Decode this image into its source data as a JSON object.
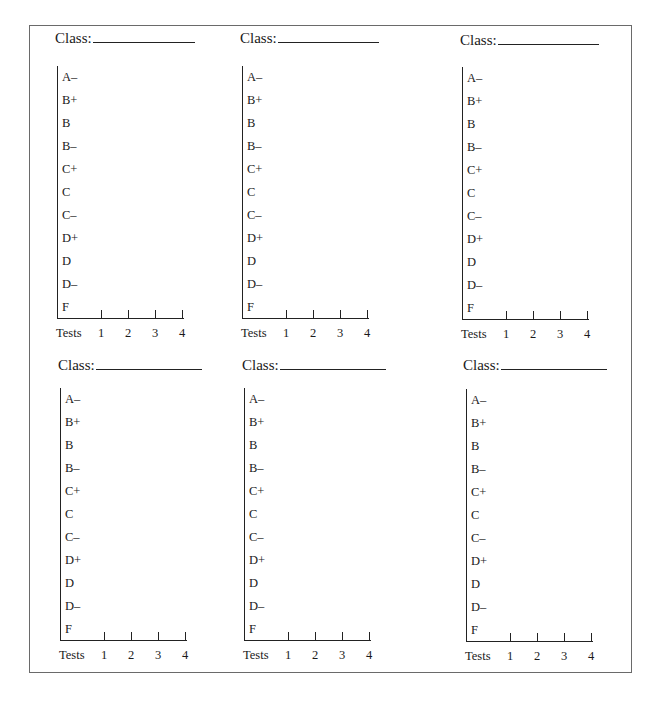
{
  "sheet": {
    "class_label": "Class:",
    "y_axis_grades": [
      "A–",
      "B+",
      "B",
      "B–",
      "C+",
      "C",
      "C–",
      "D+",
      "D",
      "D–",
      "F"
    ],
    "x_axis_title": "Tests",
    "x_axis_ticks": [
      "1",
      "2",
      "3",
      "4"
    ]
  },
  "panels": [
    {
      "class_label": "Class:",
      "class_value": ""
    },
    {
      "class_label": "Class:",
      "class_value": ""
    },
    {
      "class_label": "Class:",
      "class_value": ""
    },
    {
      "class_label": "Class:",
      "class_value": ""
    },
    {
      "class_label": "Class:",
      "class_value": ""
    },
    {
      "class_label": "Class:",
      "class_value": ""
    }
  ],
  "colors": {
    "ink": "#1a1a1a",
    "frame": "#6a6a6a",
    "background": "#ffffff"
  }
}
